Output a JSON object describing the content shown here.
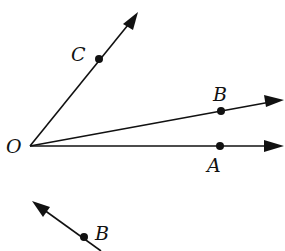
{
  "diagram": {
    "type": "geometry-rays",
    "colors": {
      "ink": "#111111",
      "background": "#ffffff"
    },
    "vertex": {
      "label": "O",
      "x": 30,
      "y": 146
    },
    "rays": [
      {
        "name": "ray-OC",
        "through": {
          "label": "C",
          "x": 99,
          "y": 59
        },
        "tip": {
          "x": 138,
          "y": 12
        }
      },
      {
        "name": "ray-OB",
        "through": {
          "label": "B",
          "x": 221,
          "y": 111
        },
        "tip": {
          "x": 284,
          "y": 100
        }
      },
      {
        "name": "ray-OA",
        "through": {
          "label": "A",
          "x": 220,
          "y": 146
        },
        "tip": {
          "x": 284,
          "y": 146
        }
      }
    ],
    "second_figure": {
      "name": "ray-through-B",
      "point": {
        "label": "B",
        "x": 84,
        "y": 237
      },
      "tip": {
        "x": 32,
        "y": 201
      },
      "tail": {
        "x": 101,
        "y": 251
      }
    }
  },
  "labels": {
    "O": "O",
    "C": "C",
    "B": "B",
    "A": "A",
    "B2": "B"
  }
}
